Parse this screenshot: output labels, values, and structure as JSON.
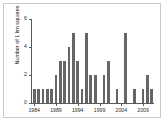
{
  "chart_data": {
    "type": "bar",
    "title": "",
    "subtitle": "",
    "xlabel": "",
    "ylabel": "Number of 1 km squares",
    "ylim": [
      0,
      6
    ],
    "yticks": [
      0,
      2,
      4,
      6
    ],
    "ytick_labels": [
      "0",
      "2",
      "4",
      "6"
    ],
    "xlim": [
      1983,
      2012
    ],
    "xticks": [
      1984,
      1989,
      1994,
      1999,
      2004,
      2009
    ],
    "xtick_labels": [
      "1984",
      "1989",
      "1994",
      "1999",
      "2004",
      "2009"
    ],
    "grid": false,
    "legend": null,
    "bar_color": "#666666",
    "axis_color": "#5a5a5a",
    "background": "#ffffff",
    "categories": [
      1984,
      1985,
      1986,
      1987,
      1988,
      1989,
      1990,
      1991,
      1992,
      1993,
      1994,
      1995,
      1996,
      1997,
      1998,
      1999,
      2000,
      2001,
      2002,
      2003,
      2004,
      2005,
      2006,
      2007,
      2008,
      2009,
      2010,
      2011
    ],
    "values": [
      1,
      1,
      1,
      1,
      1,
      2,
      3,
      3,
      4,
      5,
      3,
      1,
      5,
      2,
      2,
      0,
      2,
      3,
      0,
      1,
      0,
      5,
      0,
      1,
      0,
      1,
      2,
      1
    ],
    "annotations": []
  }
}
